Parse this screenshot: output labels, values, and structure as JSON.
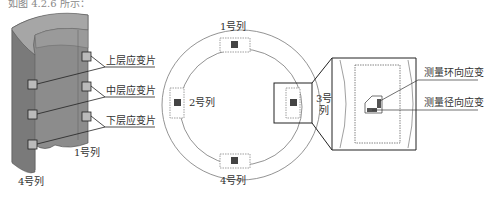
{
  "caption": {
    "partial_text": "如图 4.2.6 所示："
  },
  "cylinder_view": {
    "strain_gauge_labels": [
      "上层应变片",
      "中层应变片",
      "下层应变片"
    ],
    "column_labels": {
      "front": "1号列",
      "left_bottom": "4号列"
    }
  },
  "ring_view": {
    "column_labels": {
      "top": "1号列",
      "left": "2号列",
      "right_line1": "3号",
      "right_line2": "列",
      "bottom": "4号列"
    }
  },
  "detail_view": {
    "labels": [
      "测量环向应变",
      "测量径向应变"
    ]
  },
  "colors": {
    "cylinder_fill": "#8a8a8a",
    "cylinder_top": "#a8a8a8",
    "line": "#333333",
    "ring_line": "#777777"
  }
}
